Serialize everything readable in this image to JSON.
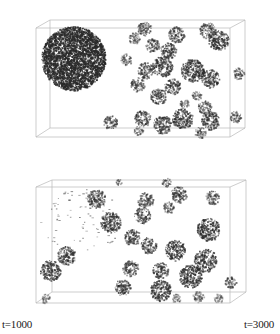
{
  "figure": {
    "panels": [
      {
        "id": "top",
        "description": "3D simulation box: one large dense spherical cluster on left, many smaller clusters on right",
        "box": {
          "front": [
            36,
            28,
            230,
            137
          ],
          "back": [
            50,
            20,
            245,
            128
          ]
        },
        "clusters": [
          {
            "x": 73,
            "y": 58,
            "r": 32,
            "d": 0.95,
            "kind": "dense"
          },
          {
            "x": 144,
            "y": 28,
            "r": 6,
            "d": 0.6
          },
          {
            "x": 134,
            "y": 38,
            "r": 5,
            "d": 0.55
          },
          {
            "x": 152,
            "y": 45,
            "r": 6,
            "d": 0.6
          },
          {
            "x": 176,
            "y": 34,
            "r": 7,
            "d": 0.65
          },
          {
            "x": 168,
            "y": 50,
            "r": 7,
            "d": 0.7
          },
          {
            "x": 162,
            "y": 66,
            "r": 9,
            "d": 0.75
          },
          {
            "x": 126,
            "y": 59,
            "r": 5,
            "d": 0.55
          },
          {
            "x": 145,
            "y": 70,
            "r": 7,
            "d": 0.65
          },
          {
            "x": 137,
            "y": 84,
            "r": 6,
            "d": 0.6
          },
          {
            "x": 172,
            "y": 86,
            "r": 7,
            "d": 0.65
          },
          {
            "x": 158,
            "y": 96,
            "r": 7,
            "d": 0.7
          },
          {
            "x": 192,
            "y": 70,
            "r": 10,
            "d": 0.8
          },
          {
            "x": 210,
            "y": 78,
            "r": 8,
            "d": 0.7
          },
          {
            "x": 207,
            "y": 30,
            "r": 7,
            "d": 0.6
          },
          {
            "x": 218,
            "y": 40,
            "r": 9,
            "d": 0.75
          },
          {
            "x": 238,
            "y": 73,
            "r": 5,
            "d": 0.6
          },
          {
            "x": 196,
            "y": 95,
            "r": 4,
            "d": 0.55
          },
          {
            "x": 184,
            "y": 103,
            "r": 4,
            "d": 0.5
          },
          {
            "x": 204,
            "y": 107,
            "r": 6,
            "d": 0.6
          },
          {
            "x": 142,
            "y": 118,
            "r": 7,
            "d": 0.65
          },
          {
            "x": 162,
            "y": 124,
            "r": 8,
            "d": 0.7
          },
          {
            "x": 182,
            "y": 118,
            "r": 9,
            "d": 0.75
          },
          {
            "x": 210,
            "y": 120,
            "r": 8,
            "d": 0.7
          },
          {
            "x": 235,
            "y": 116,
            "r": 5,
            "d": 0.6
          },
          {
            "x": 110,
            "y": 122,
            "r": 6,
            "d": 0.65
          },
          {
            "x": 200,
            "y": 132,
            "r": 5,
            "d": 0.55
          },
          {
            "x": 138,
            "y": 130,
            "r": 4,
            "d": 0.5
          }
        ]
      },
      {
        "id": "bottom",
        "description": "3D simulation box: large cluster dissolved into sparse dots at upper left, many small compact clusters distributed",
        "box": {
          "front": [
            36,
            27,
            230,
            143
          ],
          "back": [
            52,
            20,
            246,
            132
          ]
        },
        "clusters": [
          {
            "x": 96,
            "y": 38,
            "r": 8,
            "d": 0.65
          },
          {
            "x": 110,
            "y": 62,
            "r": 9,
            "d": 0.75
          },
          {
            "x": 145,
            "y": 40,
            "r": 7,
            "d": 0.6
          },
          {
            "x": 142,
            "y": 55,
            "r": 7,
            "d": 0.65
          },
          {
            "x": 178,
            "y": 34,
            "r": 7,
            "d": 0.65
          },
          {
            "x": 168,
            "y": 47,
            "r": 5,
            "d": 0.55
          },
          {
            "x": 212,
            "y": 37,
            "r": 6,
            "d": 0.6
          },
          {
            "x": 166,
            "y": 22,
            "r": 4,
            "d": 0.5
          },
          {
            "x": 118,
            "y": 22,
            "r": 3,
            "d": 0.45
          },
          {
            "x": 208,
            "y": 69,
            "r": 10,
            "d": 0.8
          },
          {
            "x": 132,
            "y": 77,
            "r": 7,
            "d": 0.65
          },
          {
            "x": 148,
            "y": 85,
            "r": 7,
            "d": 0.65
          },
          {
            "x": 175,
            "y": 90,
            "r": 9,
            "d": 0.8
          },
          {
            "x": 66,
            "y": 95,
            "r": 8,
            "d": 0.7
          },
          {
            "x": 50,
            "y": 110,
            "r": 9,
            "d": 0.75
          },
          {
            "x": 130,
            "y": 108,
            "r": 7,
            "d": 0.65
          },
          {
            "x": 160,
            "y": 110,
            "r": 7,
            "d": 0.65
          },
          {
            "x": 205,
            "y": 100,
            "r": 10,
            "d": 0.75
          },
          {
            "x": 190,
            "y": 116,
            "r": 10,
            "d": 0.8
          },
          {
            "x": 230,
            "y": 122,
            "r": 5,
            "d": 0.6
          },
          {
            "x": 122,
            "y": 127,
            "r": 7,
            "d": 0.7
          },
          {
            "x": 160,
            "y": 130,
            "r": 9,
            "d": 0.8
          },
          {
            "x": 198,
            "y": 136,
            "r": 5,
            "d": 0.5
          },
          {
            "x": 176,
            "y": 138,
            "r": 4,
            "d": 0.45
          },
          {
            "x": 45,
            "y": 138,
            "r": 4,
            "d": 0.45
          },
          {
            "x": 218,
            "y": 138,
            "r": 4,
            "d": 0.45
          }
        ],
        "sparse_region": {
          "x": 80,
          "y": 60,
          "rx": 42,
          "ry": 32,
          "count": 90
        }
      }
    ],
    "labels": {
      "left": "t=1000",
      "right": "t=3000"
    },
    "colors": {
      "particle": "#2a2a2a",
      "box_edge": "#b8b8b8",
      "background": "#ffffff"
    }
  }
}
